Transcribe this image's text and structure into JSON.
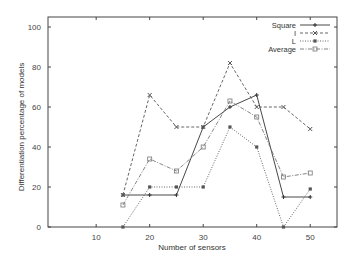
{
  "chart_data": {
    "type": "line",
    "title": "",
    "xlabel": "Number of sensors",
    "ylabel": "Differentiation percentage of models",
    "xlim": [
      1,
      55
    ],
    "ylim": [
      0,
      105
    ],
    "x_ticks": [
      10,
      20,
      30,
      40,
      50
    ],
    "y_ticks": [
      0,
      20,
      40,
      60,
      80,
      100
    ],
    "grid": false,
    "legend_position": "top-right",
    "x": [
      15,
      20,
      25,
      30,
      35,
      40,
      45,
      50
    ],
    "series": [
      {
        "name": "Square",
        "style": "solid",
        "marker": "plus",
        "color": "#333333",
        "values": [
          16,
          16,
          16,
          50,
          60,
          66,
          15,
          15
        ]
      },
      {
        "name": "I",
        "style": "dashed",
        "marker": "cross",
        "color": "#555555",
        "values": [
          16,
          66,
          50,
          50,
          82,
          60,
          60,
          49
        ]
      },
      {
        "name": "L",
        "style": "dotted",
        "marker": "filled-square",
        "color": "#555555",
        "values": [
          0,
          20,
          20,
          20,
          50,
          40,
          0,
          19
        ]
      },
      {
        "name": "Average",
        "style": "dash-dot",
        "marker": "open-square",
        "color": "#777777",
        "values": [
          11,
          34,
          28,
          40,
          63,
          55,
          25,
          27
        ]
      }
    ]
  }
}
